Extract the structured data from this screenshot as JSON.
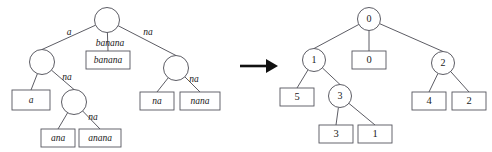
{
  "figure": {
    "type": "diagram",
    "arrow": {
      "glyph": "→",
      "name": "transformation-arrow"
    },
    "left_tree": {
      "name": "suffix-tree-with-string-labels",
      "nodes": [
        {
          "id": "L-root",
          "label": "",
          "cx": 107,
          "cy": 20,
          "r": 12.5
        },
        {
          "id": "L-a",
          "label": "",
          "cx": 42,
          "cy": 62,
          "r": 12.5
        },
        {
          "id": "L-na",
          "label": "",
          "cx": 176,
          "cy": 68,
          "r": 12.5
        },
        {
          "id": "L-ana",
          "label": "",
          "cx": 74,
          "cy": 102,
          "r": 12.5
        }
      ],
      "leaves": [
        {
          "id": "L-leaf-a",
          "label": "a",
          "x": 12,
          "y": 90,
          "w": 38,
          "h": 20
        },
        {
          "id": "L-leaf-banana",
          "label": "banana",
          "x": 86,
          "y": 51,
          "w": 44,
          "h": 18
        },
        {
          "id": "L-leaf-ana",
          "label": "ana",
          "x": 41,
          "y": 129,
          "w": 34,
          "h": 18
        },
        {
          "id": "L-leaf-anana",
          "label": "anana",
          "x": 79,
          "y": 129,
          "w": 42,
          "h": 18
        },
        {
          "id": "L-leaf-na",
          "label": "na",
          "x": 140,
          "y": 92,
          "w": 34,
          "h": 18
        },
        {
          "id": "L-leaf-nana",
          "label": "nana",
          "x": 180,
          "y": 92,
          "w": 40,
          "h": 18
        }
      ],
      "edges": [
        {
          "from": "L-root",
          "to": "L-a",
          "label": "a",
          "lx": 69,
          "ly": 33
        },
        {
          "from": "L-root",
          "to": "L-leaf-banana",
          "label": "banana",
          "lx": 110,
          "ly": 44
        },
        {
          "from": "L-root",
          "to": "L-na",
          "label": "na",
          "lx": 148,
          "ly": 33
        },
        {
          "from": "L-a",
          "to": "L-leaf-a",
          "label": "",
          "lx": 0,
          "ly": 0
        },
        {
          "from": "L-a",
          "to": "L-ana",
          "label": "na",
          "lx": 67,
          "ly": 78
        },
        {
          "from": "L-ana",
          "to": "L-leaf-ana",
          "label": "",
          "lx": 0,
          "ly": 0
        },
        {
          "from": "L-ana",
          "to": "L-leaf-anana",
          "label": "na",
          "lx": 93,
          "ly": 118
        },
        {
          "from": "L-na",
          "to": "L-leaf-na",
          "label": "",
          "lx": 0,
          "ly": 0
        },
        {
          "from": "L-na",
          "to": "L-leaf-nana",
          "label": "na",
          "lx": 194,
          "ly": 80
        }
      ]
    },
    "right_tree": {
      "name": "suffix-tree-with-numeric-labels",
      "nodes": [
        {
          "id": "R-root",
          "label": "0",
          "cx": 369,
          "cy": 19,
          "r": 11.5
        },
        {
          "id": "R-1",
          "label": "1",
          "cx": 314,
          "cy": 60,
          "r": 11.5
        },
        {
          "id": "R-2",
          "label": "2",
          "cx": 443,
          "cy": 63,
          "r": 11.5
        },
        {
          "id": "R-3",
          "label": "3",
          "cx": 340,
          "cy": 96,
          "r": 11.5
        }
      ],
      "leaves": [
        {
          "id": "R-leaf-0",
          "label": "0",
          "x": 352,
          "y": 51,
          "w": 34,
          "h": 18
        },
        {
          "id": "R-leaf-5",
          "label": "5",
          "x": 280,
          "y": 88,
          "w": 34,
          "h": 18
        },
        {
          "id": "R-leaf-3",
          "label": "3",
          "x": 319,
          "y": 125,
          "w": 34,
          "h": 18
        },
        {
          "id": "R-leaf-1",
          "label": "1",
          "x": 358,
          "y": 125,
          "w": 34,
          "h": 18
        },
        {
          "id": "R-leaf-4",
          "label": "4",
          "x": 412,
          "y": 92,
          "w": 34,
          "h": 18
        },
        {
          "id": "R-leaf-2",
          "label": "2",
          "x": 452,
          "y": 92,
          "w": 34,
          "h": 18
        }
      ],
      "edges": [
        {
          "from": "R-root",
          "to": "R-1"
        },
        {
          "from": "R-root",
          "to": "R-leaf-0"
        },
        {
          "from": "R-root",
          "to": "R-2"
        },
        {
          "from": "R-1",
          "to": "R-leaf-5"
        },
        {
          "from": "R-1",
          "to": "R-3"
        },
        {
          "from": "R-3",
          "to": "R-leaf-3"
        },
        {
          "from": "R-3",
          "to": "R-leaf-1"
        },
        {
          "from": "R-2",
          "to": "R-leaf-4"
        },
        {
          "from": "R-2",
          "to": "R-leaf-2"
        }
      ]
    },
    "colors": {
      "stroke": "#4a4a52",
      "box_stroke": "#55555d",
      "text": "#1a1a1a",
      "arrow": "#111111",
      "background": "#ffffff"
    }
  }
}
